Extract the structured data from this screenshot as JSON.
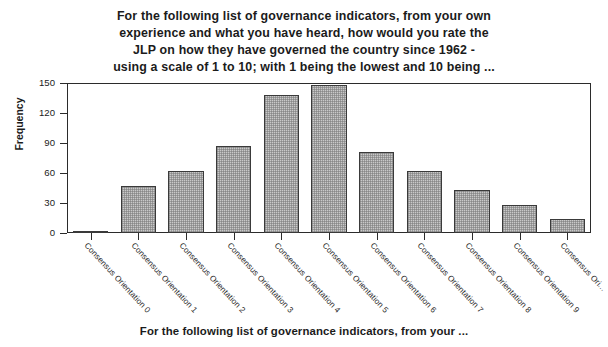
{
  "chart_data": {
    "type": "bar",
    "title_lines": [
      "For the following list of governance indicators, from your own",
      "experience and what you have heard, how would you rate the",
      "JLP on how they have governed the country since 1962 -",
      "using a scale of 1 to 10; with 1 being the lowest and 10 being ..."
    ],
    "xlabel": "For the following list of governance indicators, from your ...",
    "ylabel": "Frequency",
    "categories": [
      "Consensus Orientation 0",
      "Consensus Orientation 1",
      "Consensus Orientation 2",
      "Consensus Orientation 3",
      "Consensus Orientation 4",
      "Consensus Orientation 5",
      "Consensus Orientation 6",
      "Consensus Orientation 7",
      "Consensus Orientation 8",
      "Consensus Orientation 9",
      "Consensus Ori..."
    ],
    "values": [
      2,
      47,
      62,
      87,
      138,
      148,
      81,
      62,
      43,
      28,
      14
    ],
    "ylim": [
      0,
      150
    ],
    "yticks": [
      0,
      30,
      60,
      90,
      120,
      150
    ],
    "ytick_labels": [
      "0",
      "30",
      "60",
      "90",
      "120",
      "150"
    ],
    "grid": false,
    "legend": false,
    "bar_fill_color": "#c9c9c9",
    "bar_edge_color": "#3a3a3a",
    "axis_color": "#2b2b2b",
    "background_color": "#ffffff"
  }
}
